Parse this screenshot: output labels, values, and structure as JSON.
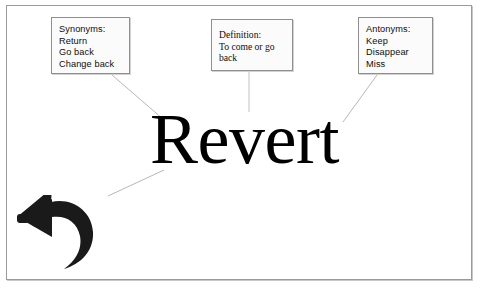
{
  "slide": {
    "headword": "Revert",
    "frame_border_color": "#9a9a9a",
    "background_color": "#ffffff",
    "text_color": "#000000"
  },
  "callouts": [
    {
      "id": "synonyms",
      "heading": "Synonyms:",
      "items": [
        "Return",
        "Go back",
        "Change back"
      ],
      "font": "sans"
    },
    {
      "id": "definition",
      "heading": "Definition:",
      "items": [
        "To come or go",
        "back"
      ],
      "font": "serif"
    },
    {
      "id": "antonyms",
      "heading": "Antonyms:",
      "items": [
        "Keep",
        "Disappear",
        "Miss"
      ],
      "font": "sans"
    }
  ],
  "icon": {
    "name": "revert-arrow-icon",
    "color": "#1a1a1a",
    "description": "curved undo arrow pointing left"
  },
  "connectors": {
    "color": "#b8b8b8",
    "count": 4
  }
}
